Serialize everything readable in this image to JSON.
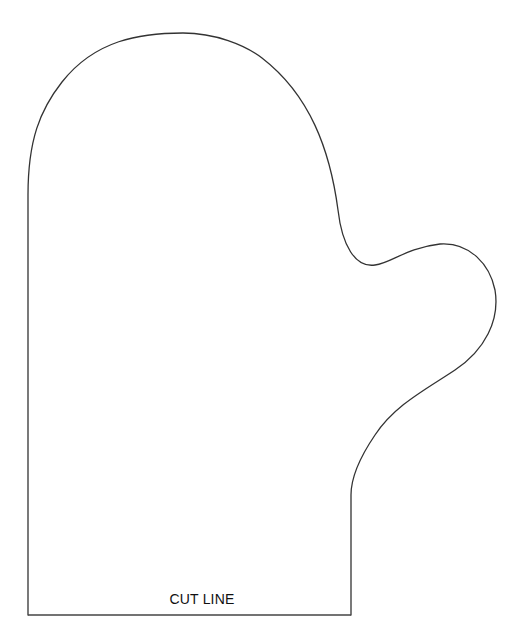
{
  "template": {
    "name": "Mitten pattern",
    "cut_label": "CUT LINE",
    "outline_color": "#333333",
    "background_color": "#ffffff"
  }
}
